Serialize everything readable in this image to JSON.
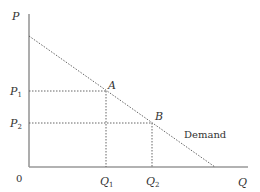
{
  "diagram": {
    "type": "demand-curve",
    "axes": {
      "y_label": "P",
      "x_label": "Q",
      "origin_label": "0"
    },
    "curve": {
      "label": "Demand",
      "style": "dotted",
      "start": {
        "x": 29,
        "y": 36
      },
      "end": {
        "x": 215,
        "y": 167
      }
    },
    "points": [
      {
        "name": "A",
        "price_label": "P",
        "price_sub": "1",
        "qty_label": "Q",
        "qty_sub": "1"
      },
      {
        "name": "B",
        "price_label": "P",
        "price_sub": "2",
        "qty_label": "Q",
        "qty_sub": "2"
      }
    ],
    "colors": {
      "axis": "#999999",
      "curve": "#555555",
      "guide": "#555555",
      "text": "#333333"
    }
  }
}
